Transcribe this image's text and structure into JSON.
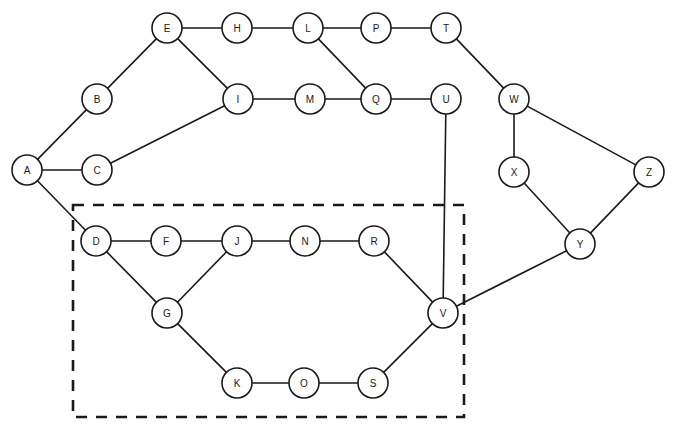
{
  "diagram": {
    "canvas": {
      "width": 673,
      "height": 433,
      "background": "#ffffff"
    },
    "style": {
      "node_radius": 15,
      "node_fill": "#ffffff",
      "node_stroke": "#1a1a1a",
      "node_stroke_width": 1.6,
      "edge_stroke": "#1a1a1a",
      "edge_stroke_width": 1.6,
      "label_font_size": 10,
      "selection_stroke": "#1a1a1a",
      "selection_stroke_width": 2.6,
      "selection_dash": "11 9"
    },
    "nodes": [
      {
        "id": "A",
        "label": "A",
        "x": 27,
        "y": 170
      },
      {
        "id": "B",
        "label": "B",
        "x": 97,
        "y": 99
      },
      {
        "id": "C",
        "label": "C",
        "x": 97,
        "y": 170
      },
      {
        "id": "D",
        "label": "D",
        "x": 96,
        "y": 241
      },
      {
        "id": "E",
        "label": "E",
        "x": 167,
        "y": 28
      },
      {
        "id": "F",
        "label": "F",
        "x": 166,
        "y": 241
      },
      {
        "id": "G",
        "label": "G",
        "x": 167,
        "y": 313
      },
      {
        "id": "H",
        "label": "H",
        "x": 237,
        "y": 28
      },
      {
        "id": "I",
        "label": "I",
        "x": 238,
        "y": 99
      },
      {
        "id": "J",
        "label": "J",
        "x": 237,
        "y": 241
      },
      {
        "id": "K",
        "label": "K",
        "x": 237,
        "y": 383
      },
      {
        "id": "L",
        "label": "L",
        "x": 308,
        "y": 28
      },
      {
        "id": "M",
        "label": "M",
        "x": 310,
        "y": 99
      },
      {
        "id": "N",
        "label": "N",
        "x": 305,
        "y": 241
      },
      {
        "id": "O",
        "label": "O",
        "x": 304,
        "y": 383
      },
      {
        "id": "P",
        "label": "P",
        "x": 376,
        "y": 28
      },
      {
        "id": "Q",
        "label": "Q",
        "x": 376,
        "y": 99
      },
      {
        "id": "R",
        "label": "R",
        "x": 374,
        "y": 241
      },
      {
        "id": "S",
        "label": "S",
        "x": 373,
        "y": 383
      },
      {
        "id": "T",
        "label": "T",
        "x": 446,
        "y": 28
      },
      {
        "id": "U",
        "label": "U",
        "x": 446,
        "y": 99
      },
      {
        "id": "V",
        "label": "V",
        "x": 443,
        "y": 313
      },
      {
        "id": "W",
        "label": "W",
        "x": 514,
        "y": 99
      },
      {
        "id": "X",
        "label": "X",
        "x": 514,
        "y": 172
      },
      {
        "id": "Y",
        "label": "Y",
        "x": 580,
        "y": 244
      },
      {
        "id": "Z",
        "label": "Z",
        "x": 649,
        "y": 172
      }
    ],
    "edges": [
      {
        "source": "A",
        "target": "B"
      },
      {
        "source": "A",
        "target": "C"
      },
      {
        "source": "A",
        "target": "D"
      },
      {
        "source": "B",
        "target": "E"
      },
      {
        "source": "C",
        "target": "I"
      },
      {
        "source": "E",
        "target": "H"
      },
      {
        "source": "E",
        "target": "I"
      },
      {
        "source": "H",
        "target": "L"
      },
      {
        "source": "I",
        "target": "M"
      },
      {
        "source": "L",
        "target": "P"
      },
      {
        "source": "L",
        "target": "Q"
      },
      {
        "source": "M",
        "target": "Q"
      },
      {
        "source": "P",
        "target": "T"
      },
      {
        "source": "Q",
        "target": "U"
      },
      {
        "source": "T",
        "target": "W"
      },
      {
        "source": "U",
        "target": "V"
      },
      {
        "source": "W",
        "target": "X"
      },
      {
        "source": "W",
        "target": "Z"
      },
      {
        "source": "X",
        "target": "Y"
      },
      {
        "source": "Y",
        "target": "Z"
      },
      {
        "source": "V",
        "target": "Y"
      },
      {
        "source": "D",
        "target": "F"
      },
      {
        "source": "D",
        "target": "G"
      },
      {
        "source": "F",
        "target": "J"
      },
      {
        "source": "G",
        "target": "J"
      },
      {
        "source": "G",
        "target": "K"
      },
      {
        "source": "J",
        "target": "N"
      },
      {
        "source": "N",
        "target": "R"
      },
      {
        "source": "R",
        "target": "V"
      },
      {
        "source": "K",
        "target": "O"
      },
      {
        "source": "O",
        "target": "S"
      },
      {
        "source": "S",
        "target": "V"
      }
    ],
    "selection_region": {
      "name": "dashed-selection-boundary",
      "x": 73,
      "y": 205,
      "width": 391,
      "height": 212
    }
  }
}
